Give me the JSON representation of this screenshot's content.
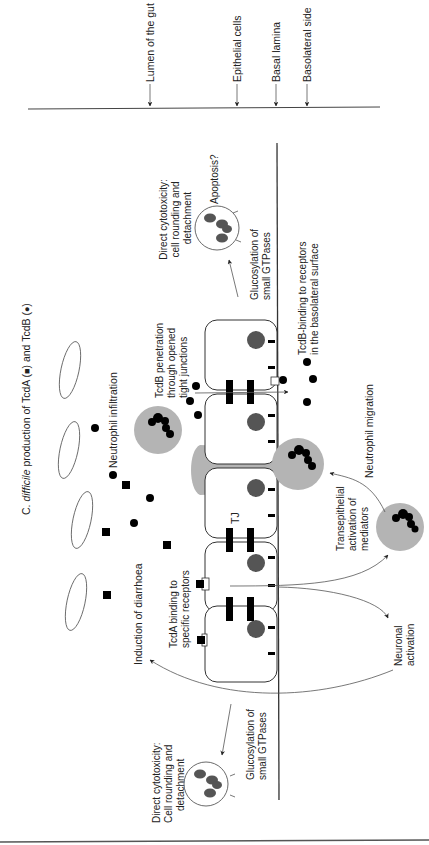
{
  "figure": {
    "title_prefix": "C. ",
    "title_italic": "difficile",
    "title_rest": " production of TcdA (",
    "title_mid": ") and TcdB (",
    "title_end": ")",
    "legend": [
      {
        "symbol": "square",
        "toxin": "TcdA"
      },
      {
        "symbol": "circle",
        "toxin": "TcdB"
      }
    ]
  },
  "layer_labels": [
    {
      "id": "lumen",
      "text": "Lumen of the gut"
    },
    {
      "id": "epithelial",
      "text": "Epithelial cells"
    },
    {
      "id": "basal",
      "text": "Basal lamina"
    },
    {
      "id": "basolateral",
      "text": "Basolateral side"
    }
  ],
  "annotations": {
    "neutrophil_infiltration": "Neutrophil infiltration",
    "tcdb_penetration": [
      "TcdB penetration",
      "through opened",
      "tight junctions"
    ],
    "tj": "TJ",
    "tcda_binding": [
      "TcdA binding to",
      "specific receptors"
    ],
    "induction_diarrhoea": "Induction of diarrhoea",
    "neuronal_activation": [
      "Neuronal",
      "activation"
    ],
    "transepithelial": [
      "Transepithelial",
      "activation of",
      "mediators"
    ],
    "neutrophil_migration": "Neutrophil migration",
    "tcdb_binding_basolateral": [
      "TcdB-binding to receptors",
      "in the basolateral surface"
    ],
    "glucosylation_top": [
      "Glucosylation of",
      "small GTPases"
    ],
    "cytotoxicity_top": [
      "Direct cytotoxicity:",
      "cell rounding and",
      "detachment"
    ],
    "apoptosis": "Apoptosis?",
    "glucosylation_bottom": [
      "Glucosylation of",
      "small GTPases"
    ],
    "cytotoxicity_bottom": [
      "Direct cytotoxicity:",
      "Cell rounding and",
      "detachment"
    ]
  },
  "colors": {
    "neutrophil": "#b4b4b4",
    "nucleus": "#555555",
    "toxin": "#000000"
  }
}
